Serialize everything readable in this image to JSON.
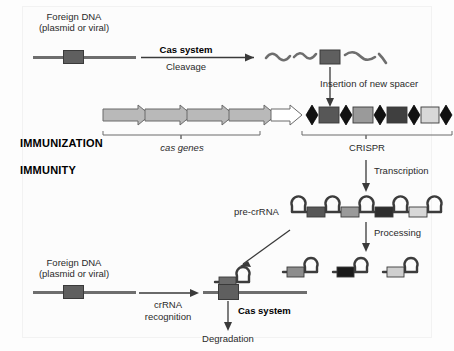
{
  "figure": {
    "stage_labels": {
      "immunization": "IMMUNIZATION",
      "immunity": "IMMUNITY"
    },
    "top_row": {
      "foreign_dna_label_line1": "Foreign DNA",
      "foreign_dna_label_line2": "(plasmid or viral)",
      "process_bold": "Cas system",
      "process_sub": "Cleavage",
      "fragments_note": "cleaved DNA fragments with protospacer",
      "insertion_label": "Insertion of new spacer"
    },
    "locus": {
      "cas_genes_label": "cas genes",
      "crispr_label": "CRISPR",
      "cas_gene_count": 4,
      "cas_gene_fill": "#b9b9b9",
      "leader_fill": "#ffffff",
      "repeat_count": 6,
      "repeat_fill": "#111111",
      "spacers": [
        {
          "name": "new-spacer",
          "fill": "#575757"
        },
        {
          "name": "spacer-2",
          "fill": "#9a9a9a"
        },
        {
          "name": "spacer-3",
          "fill": "#3f3f3f"
        },
        {
          "name": "spacer-4",
          "fill": "#d8d8d8"
        }
      ]
    },
    "transcription": {
      "label": "Transcription",
      "pre_crrna_label": "pre-crRNA",
      "hairpin_count": 5,
      "spacers": [
        {
          "name": "pre-spacer-1",
          "fill": "#575757"
        },
        {
          "name": "pre-spacer-2",
          "fill": "#9a9a9a"
        },
        {
          "name": "pre-spacer-3",
          "fill": "#2e2e2e"
        },
        {
          "name": "pre-spacer-4",
          "fill": "#d8d8d8"
        }
      ]
    },
    "processing": {
      "label": "Processing",
      "crrnas": [
        {
          "name": "crrna-1",
          "fill": "#8d8d8d"
        },
        {
          "name": "crrna-2",
          "fill": "#1a1a1a"
        },
        {
          "name": "crrna-3",
          "fill": "#cfcfcf"
        }
      ]
    },
    "bottom_row": {
      "foreign_dna_label_line1": "Foreign DNA",
      "foreign_dna_label_line2": "(plasmid or viral)",
      "recognition_line1": "crRNA",
      "recognition_line2": "recognition",
      "cas_system_label": "Cas system",
      "degradation_label": "Degradation"
    },
    "colors": {
      "dna_line": "#6e6e6e",
      "protospacer": "#5f5f5f",
      "ink": "#2a2a2a",
      "background": "#fdfdfd"
    }
  }
}
